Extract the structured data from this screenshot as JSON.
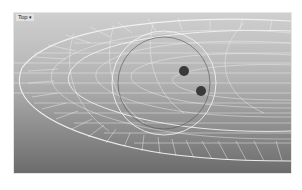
{
  "viewport": {
    "label": "Top",
    "menu_caret": "▾",
    "background_top": "#cfcfcf",
    "background_bottom": "#6c6c6c",
    "wire_color": "#f2f2f2"
  },
  "scene": {
    "object": "wireframe-bowl-mesh",
    "manipulator_circle": "circle-handle",
    "points": [
      {
        "name": "control-point-1",
        "x": 170,
        "y": 58
      },
      {
        "name": "control-point-2",
        "x": 187,
        "y": 78
      }
    ]
  }
}
